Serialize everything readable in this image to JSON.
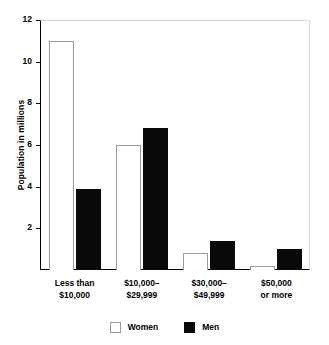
{
  "chart_data": {
    "type": "bar",
    "title": "",
    "subtitle": "",
    "xlabel": "",
    "ylabel": "Population in millions",
    "categories": [
      "Less than\n$10,000",
      "$10,000–\n$29,999",
      "$30,000–\n$49,999",
      "$50,000\nor more"
    ],
    "category_lines": [
      [
        "Less than",
        "$10,000"
      ],
      [
        "$10,000–",
        "$29,999"
      ],
      [
        "$30,000–",
        "$49,999"
      ],
      [
        "$50,000",
        "or more"
      ]
    ],
    "series": [
      {
        "name": "Women",
        "color": "#ffffff",
        "values": [
          11.0,
          6.0,
          0.8,
          0.2
        ]
      },
      {
        "name": "Men",
        "color": "#000000",
        "values": [
          3.9,
          6.8,
          1.4,
          1.0
        ]
      }
    ],
    "ylim": [
      0,
      12
    ],
    "yticks": [
      0,
      2,
      4,
      6,
      8,
      10,
      12
    ],
    "ytick_labels": [
      "",
      "2",
      "4",
      "6",
      "8",
      "10",
      "12"
    ],
    "grid": false,
    "legend_position": "bottom"
  },
  "axis": {
    "y_title": "Population in millions",
    "y_ticks": [
      {
        "value": 12,
        "label": "12"
      },
      {
        "value": 10,
        "label": "10"
      },
      {
        "value": 8,
        "label": "8"
      },
      {
        "value": 6,
        "label": "6"
      },
      {
        "value": 4,
        "label": "4"
      },
      {
        "value": 2,
        "label": "2"
      }
    ]
  },
  "legend": {
    "entries": [
      {
        "label": "Women",
        "swatch": "white-square-swatch"
      },
      {
        "label": "Men",
        "swatch": "black-square-swatch"
      }
    ]
  }
}
